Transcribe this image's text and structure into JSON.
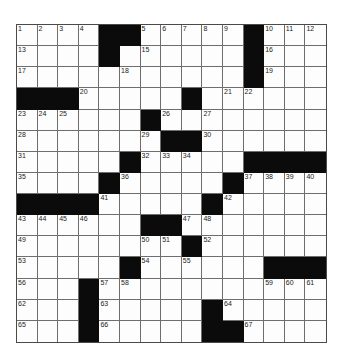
{
  "puzzle": {
    "rows": 15,
    "cols": 15,
    "colors": {
      "block": "#0b0b0b",
      "cell": "#fdfdfd",
      "gridline": "#6e6e6e",
      "number": "#222222"
    },
    "layout": [
      "....##.....#...",
      "....#......#...",
      "...........#...",
      "###.....#......",
      "......#........",
      ".......##......",
      ".....#.....####",
      "....#.....#....",
      "####.....#.....",
      "......##.......",
      "........#......",
      ".....#......###",
      "...#...........",
      "...#.....#.....",
      "...#.....##...."
    ],
    "numbers": [
      {
        "r": 0,
        "c": 0,
        "n": "1"
      },
      {
        "r": 0,
        "c": 1,
        "n": "2"
      },
      {
        "r": 0,
        "c": 2,
        "n": "3"
      },
      {
        "r": 0,
        "c": 3,
        "n": "4"
      },
      {
        "r": 0,
        "c": 6,
        "n": "5"
      },
      {
        "r": 0,
        "c": 7,
        "n": "6"
      },
      {
        "r": 0,
        "c": 8,
        "n": "7"
      },
      {
        "r": 0,
        "c": 9,
        "n": "8"
      },
      {
        "r": 0,
        "c": 10,
        "n": "9"
      },
      {
        "r": 0,
        "c": 12,
        "n": "10"
      },
      {
        "r": 0,
        "c": 13,
        "n": "11"
      },
      {
        "r": 0,
        "c": 14,
        "n": "12"
      },
      {
        "r": 1,
        "c": 0,
        "n": "13"
      },
      {
        "r": 1,
        "c": 4,
        "n": "14"
      },
      {
        "r": 1,
        "c": 6,
        "n": "15"
      },
      {
        "r": 1,
        "c": 12,
        "n": "16"
      },
      {
        "r": 2,
        "c": 0,
        "n": "17"
      },
      {
        "r": 2,
        "c": 5,
        "n": "18"
      },
      {
        "r": 2,
        "c": 12,
        "n": "19"
      },
      {
        "r": 3,
        "c": 3,
        "n": "20"
      },
      {
        "r": 3,
        "c": 10,
        "n": "21"
      },
      {
        "r": 3,
        "c": 11,
        "n": "22"
      },
      {
        "r": 4,
        "c": 0,
        "n": "23"
      },
      {
        "r": 4,
        "c": 1,
        "n": "24"
      },
      {
        "r": 4,
        "c": 2,
        "n": "25"
      },
      {
        "r": 4,
        "c": 7,
        "n": "26"
      },
      {
        "r": 4,
        "c": 9,
        "n": "27"
      },
      {
        "r": 5,
        "c": 0,
        "n": "28"
      },
      {
        "r": 5,
        "c": 6,
        "n": "29"
      },
      {
        "r": 5,
        "c": 9,
        "n": "30"
      },
      {
        "r": 6,
        "c": 0,
        "n": "31"
      },
      {
        "r": 6,
        "c": 6,
        "n": "32"
      },
      {
        "r": 6,
        "c": 7,
        "n": "33"
      },
      {
        "r": 6,
        "c": 8,
        "n": "34"
      },
      {
        "r": 7,
        "c": 0,
        "n": "35"
      },
      {
        "r": 7,
        "c": 5,
        "n": "36"
      },
      {
        "r": 7,
        "c": 11,
        "n": "37"
      },
      {
        "r": 7,
        "c": 12,
        "n": "38"
      },
      {
        "r": 7,
        "c": 13,
        "n": "39"
      },
      {
        "r": 7,
        "c": 14,
        "n": "40"
      },
      {
        "r": 8,
        "c": 4,
        "n": "41"
      },
      {
        "r": 8,
        "c": 10,
        "n": "42"
      },
      {
        "r": 9,
        "c": 0,
        "n": "43"
      },
      {
        "r": 9,
        "c": 1,
        "n": "44"
      },
      {
        "r": 9,
        "c": 2,
        "n": "45"
      },
      {
        "r": 9,
        "c": 3,
        "n": "46"
      },
      {
        "r": 9,
        "c": 8,
        "n": "47"
      },
      {
        "r": 9,
        "c": 9,
        "n": "48"
      },
      {
        "r": 10,
        "c": 0,
        "n": "49"
      },
      {
        "r": 10,
        "c": 6,
        "n": "50"
      },
      {
        "r": 10,
        "c": 7,
        "n": "51"
      },
      {
        "r": 10,
        "c": 9,
        "n": "52"
      },
      {
        "r": 11,
        "c": 0,
        "n": "53"
      },
      {
        "r": 11,
        "c": 6,
        "n": "54"
      },
      {
        "r": 11,
        "c": 8,
        "n": "55"
      },
      {
        "r": 12,
        "c": 0,
        "n": "56"
      },
      {
        "r": 12,
        "c": 4,
        "n": "57"
      },
      {
        "r": 12,
        "c": 5,
        "n": "58"
      },
      {
        "r": 12,
        "c": 12,
        "n": "59"
      },
      {
        "r": 12,
        "c": 13,
        "n": "60"
      },
      {
        "r": 12,
        "c": 14,
        "n": "61"
      },
      {
        "r": 13,
        "c": 0,
        "n": "62"
      },
      {
        "r": 13,
        "c": 4,
        "n": "63"
      },
      {
        "r": 13,
        "c": 10,
        "n": "64"
      },
      {
        "r": 14,
        "c": 0,
        "n": "65"
      },
      {
        "r": 14,
        "c": 4,
        "n": "66"
      },
      {
        "r": 14,
        "c": 11,
        "n": "67"
      }
    ]
  }
}
